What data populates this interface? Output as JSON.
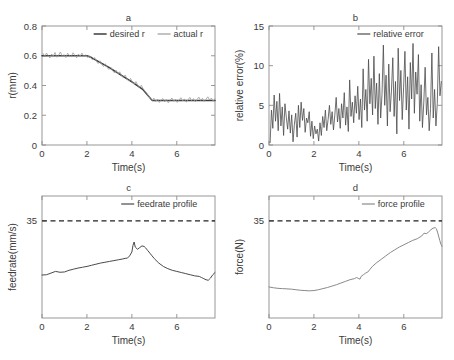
{
  "figure": {
    "type": "multi-panel-line-chart",
    "panel_count": 4,
    "background": "#ffffff"
  },
  "colors": {
    "axis": "#8c8c8c",
    "text": "#3a3a3a",
    "desired": "#3c3c3c",
    "actual": "#9a9a9a",
    "relative_error": "#4a4a4a",
    "feedrate": "#4a4a4a",
    "force": "#8a8a8a",
    "limit": "#222222"
  },
  "chart_data": [
    {
      "type": "line",
      "panel": "a",
      "title": "a",
      "xlabel": "Time(s)",
      "ylabel": "r(mm)",
      "xlim": [
        0,
        7.7
      ],
      "ylim": [
        0,
        0.8
      ],
      "xticks": [
        0,
        2,
        4,
        6
      ],
      "yticks": [
        0,
        0.2,
        0.4,
        0.6,
        0.8
      ],
      "yticklabels": [
        "0",
        "0.2",
        "0.4",
        "0.6",
        "0.8"
      ],
      "xticklabels": [
        "0",
        "2",
        "4",
        "6"
      ],
      "grid": false,
      "legend_position": "top-right",
      "series": [
        {
          "name": "desired r",
          "color": "#3c3c3c",
          "width": 1.5,
          "x": [
            0,
            0.5,
            1,
            1.5,
            2,
            2.2,
            2.5,
            3,
            3.5,
            4,
            4.5,
            4.9,
            5.2,
            5.8,
            6.4,
            7,
            7.7
          ],
          "values": [
            0.6,
            0.6,
            0.6,
            0.6,
            0.6,
            0.588,
            0.562,
            0.52,
            0.472,
            0.424,
            0.372,
            0.3,
            0.3,
            0.3,
            0.3,
            0.3,
            0.3
          ]
        },
        {
          "name": "actual r",
          "color": "#9a9a9a",
          "width": 0.8,
          "x": [
            0.05,
            0.12,
            0.2,
            0.28,
            0.35,
            0.43,
            0.5,
            0.58,
            0.66,
            0.74,
            0.82,
            0.9,
            0.98,
            1.06,
            1.14,
            1.22,
            1.3,
            1.38,
            1.46,
            1.54,
            1.62,
            1.7,
            1.78,
            1.86,
            1.94,
            2.02,
            2.1,
            2.18,
            2.26,
            2.34,
            2.42,
            2.5,
            2.58,
            2.66,
            2.74,
            2.82,
            2.9,
            2.98,
            3.06,
            3.14,
            3.22,
            3.3,
            3.38,
            3.46,
            3.54,
            3.62,
            3.7,
            3.78,
            3.86,
            3.94,
            4.02,
            4.1,
            4.18,
            4.26,
            4.34,
            4.42,
            4.5,
            4.58,
            4.66,
            4.74,
            4.82,
            4.9,
            4.98,
            5.06,
            5.14,
            5.22,
            5.3,
            5.38,
            5.46,
            5.54,
            5.62,
            5.7,
            5.78,
            5.86,
            5.94,
            6.02,
            6.1,
            6.18,
            6.26,
            6.34,
            6.42,
            6.5,
            6.58,
            6.66,
            6.74,
            6.82,
            6.9,
            6.98,
            7.06,
            7.14,
            7.22,
            7.3,
            7.38,
            7.46,
            7.54,
            7.62,
            7.7
          ],
          "values": [
            0.615,
            0.595,
            0.618,
            0.6,
            0.585,
            0.612,
            0.598,
            0.622,
            0.59,
            0.605,
            0.625,
            0.596,
            0.608,
            0.588,
            0.617,
            0.601,
            0.592,
            0.62,
            0.603,
            0.586,
            0.612,
            0.598,
            0.618,
            0.594,
            0.607,
            0.589,
            0.601,
            0.583,
            0.572,
            0.588,
            0.564,
            0.548,
            0.566,
            0.542,
            0.528,
            0.546,
            0.522,
            0.508,
            0.524,
            0.5,
            0.486,
            0.502,
            0.478,
            0.492,
            0.468,
            0.452,
            0.47,
            0.446,
            0.43,
            0.448,
            0.424,
            0.41,
            0.426,
            0.402,
            0.388,
            0.402,
            0.378,
            0.362,
            0.348,
            0.33,
            0.312,
            0.298,
            0.315,
            0.292,
            0.308,
            0.286,
            0.302,
            0.312,
            0.29,
            0.306,
            0.284,
            0.3,
            0.316,
            0.294,
            0.308,
            0.286,
            0.302,
            0.318,
            0.296,
            0.31,
            0.288,
            0.304,
            0.32,
            0.298,
            0.312,
            0.29,
            0.306,
            0.322,
            0.3,
            0.314,
            0.292,
            0.308,
            0.324,
            0.302,
            0.316,
            0.294,
            0.31
          ]
        }
      ]
    },
    {
      "type": "line",
      "panel": "b",
      "title": "b",
      "xlabel": "Time(s)",
      "ylabel": "relative error(%)",
      "xlim": [
        0,
        7.7
      ],
      "ylim": [
        0,
        15
      ],
      "xticks": [
        0,
        2,
        4,
        6
      ],
      "yticks": [
        0,
        5,
        10,
        15
      ],
      "yticklabels": [
        "0",
        "5",
        "10",
        "15"
      ],
      "xticklabels": [
        "0",
        "2",
        "4",
        "6"
      ],
      "grid": false,
      "legend_position": "top-right",
      "series": [
        {
          "name": "relative error",
          "color": "#4a4a4a",
          "width": 0.8,
          "x": [
            0.05,
            0.11,
            0.17,
            0.23,
            0.29,
            0.35,
            0.41,
            0.47,
            0.53,
            0.59,
            0.65,
            0.71,
            0.77,
            0.83,
            0.89,
            0.95,
            1.01,
            1.07,
            1.13,
            1.19,
            1.25,
            1.31,
            1.37,
            1.43,
            1.49,
            1.55,
            1.61,
            1.67,
            1.73,
            1.79,
            1.85,
            1.91,
            1.97,
            2.03,
            2.09,
            2.15,
            2.21,
            2.27,
            2.33,
            2.39,
            2.45,
            2.51,
            2.57,
            2.63,
            2.69,
            2.75,
            2.81,
            2.87,
            2.93,
            2.99,
            3.05,
            3.11,
            3.17,
            3.23,
            3.29,
            3.35,
            3.41,
            3.47,
            3.53,
            3.59,
            3.65,
            3.71,
            3.77,
            3.83,
            3.89,
            3.95,
            4.01,
            4.07,
            4.13,
            4.19,
            4.25,
            4.31,
            4.37,
            4.43,
            4.49,
            4.55,
            4.61,
            4.67,
            4.73,
            4.79,
            4.85,
            4.91,
            4.97,
            5.03,
            5.09,
            5.15,
            5.21,
            5.27,
            5.33,
            5.39,
            5.45,
            5.51,
            5.57,
            5.63,
            5.69,
            5.75,
            5.81,
            5.87,
            5.93,
            5.99,
            6.05,
            6.11,
            6.17,
            6.23,
            6.29,
            6.35,
            6.41,
            6.47,
            6.53,
            6.59,
            6.65,
            6.71,
            6.77,
            6.83,
            6.89,
            6.95,
            7.01,
            7.07,
            7.13,
            7.19,
            7.25,
            7.31,
            7.37,
            7.43,
            7.49,
            7.55,
            7.61,
            7.67
          ],
          "values": [
            0.3,
            4.4,
            2.1,
            6.3,
            3.0,
            5.5,
            1.8,
            6.5,
            2.4,
            4.8,
            1.2,
            5.2,
            3.5,
            2.0,
            4.3,
            1.5,
            3.8,
            0.4,
            2.6,
            4.0,
            1.0,
            5.0,
            2.2,
            5.4,
            3.1,
            4.6,
            1.6,
            3.4,
            2.8,
            4.2,
            1.1,
            3.0,
            0.8,
            2.4,
            1.4,
            2.0,
            0.5,
            2.8,
            1.2,
            3.6,
            2.2,
            4.4,
            1.8,
            3.2,
            5.0,
            2.6,
            4.2,
            1.9,
            3.8,
            6.0,
            2.9,
            4.6,
            2.1,
            5.2,
            3.4,
            6.6,
            2.5,
            4.8,
            1.7,
            8.2,
            3.6,
            5.4,
            2.8,
            6.2,
            4.0,
            7.4,
            3.2,
            5.8,
            2.2,
            9.6,
            4.4,
            7.0,
            3.0,
            10.8,
            5.2,
            8.4,
            3.8,
            11.2,
            4.6,
            7.8,
            2.6,
            9.0,
            3.4,
            6.4,
            12.6,
            5.0,
            8.8,
            2.4,
            10.2,
            4.2,
            6.8,
            11.0,
            3.6,
            8.0,
            1.4,
            12.2,
            5.6,
            9.4,
            3.2,
            7.2,
            11.8,
            4.4,
            8.6,
            2.0,
            10.4,
            5.8,
            12.8,
            4.0,
            9.2,
            6.4,
            11.4,
            3.0,
            7.6,
            2.2,
            5.4,
            9.8,
            3.8,
            6.0,
            1.8,
            4.6,
            11.6,
            3.4,
            7.0,
            2.4,
            5.2,
            12.4,
            6.2,
            8.0
          ]
        }
      ]
    },
    {
      "type": "line",
      "panel": "c",
      "title": "c",
      "xlabel": "Time(s)",
      "ylabel": "feedrate(mm/s)",
      "xlim": [
        0,
        7.7
      ],
      "ylim": [
        0,
        44
      ],
      "xticks": [
        0,
        2,
        4,
        6
      ],
      "yticks": [
        35
      ],
      "yticklabels": [
        "35"
      ],
      "xticklabels": [
        "0",
        "2",
        "4",
        "6"
      ],
      "grid": false,
      "legend_position": "top-right",
      "limit_line": {
        "value": 35,
        "style": "dashed",
        "color": "#222222"
      },
      "series": [
        {
          "name": "feedrate profile",
          "color": "#4a4a4a",
          "width": 1.0,
          "x": [
            0,
            0.2,
            0.4,
            0.6,
            0.8,
            1.0,
            1.2,
            1.4,
            1.6,
            1.8,
            2.0,
            2.2,
            2.4,
            2.6,
            2.8,
            3.0,
            3.2,
            3.4,
            3.6,
            3.7,
            3.8,
            3.9,
            4.0,
            4.05,
            4.1,
            4.15,
            4.25,
            4.35,
            4.45,
            4.55,
            4.6,
            4.7,
            4.8,
            4.9,
            5.0,
            5.2,
            5.4,
            5.6,
            5.8,
            6.0,
            6.2,
            6.4,
            6.6,
            6.8,
            7.0,
            7.1,
            7.2,
            7.3,
            7.4,
            7.5,
            7.6,
            7.7
          ],
          "values": [
            15.5,
            15.6,
            16.2,
            16.8,
            16.5,
            16.6,
            17.2,
            17.6,
            18.0,
            18.3,
            18.6,
            19.0,
            19.4,
            19.8,
            20.1,
            20.4,
            20.7,
            21.0,
            21.3,
            21.5,
            21.6,
            22.4,
            23.8,
            26.2,
            27.4,
            25.6,
            24.8,
            25.4,
            26.0,
            25.8,
            25.4,
            24.4,
            23.4,
            22.4,
            21.4,
            19.8,
            18.6,
            17.8,
            17.2,
            16.8,
            16.4,
            16.0,
            15.6,
            15.2,
            15.0,
            14.6,
            14.2,
            13.8,
            13.6,
            14.4,
            15.6,
            16.4
          ]
        }
      ]
    },
    {
      "type": "line",
      "panel": "d",
      "title": "d",
      "xlabel": "Time(s)",
      "ylabel": "force(N)",
      "xlim": [
        0,
        7.7
      ],
      "ylim": [
        0,
        44
      ],
      "xticks": [
        0,
        2,
        4,
        6
      ],
      "yticks": [
        35
      ],
      "yticklabels": [
        "35"
      ],
      "xticklabels": [
        "0",
        "2",
        "4",
        "6"
      ],
      "grid": false,
      "legend_position": "top-right",
      "limit_line": {
        "value": 35,
        "style": "dashed",
        "color": "#222222"
      },
      "series": [
        {
          "name": "force profile",
          "color": "#8a8a8a",
          "width": 1.0,
          "x": [
            0,
            0.2,
            0.4,
            0.6,
            0.8,
            1.0,
            1.2,
            1.4,
            1.6,
            1.8,
            2.0,
            2.2,
            2.4,
            2.6,
            2.8,
            3.0,
            3.2,
            3.4,
            3.6,
            3.8,
            3.9,
            4.0,
            4.05,
            4.1,
            4.2,
            4.3,
            4.4,
            4.5,
            4.6,
            4.8,
            5.0,
            5.2,
            5.4,
            5.6,
            5.8,
            6.0,
            6.2,
            6.4,
            6.6,
            6.8,
            6.9,
            7.0,
            7.1,
            7.2,
            7.3,
            7.4,
            7.45,
            7.5,
            7.6,
            7.65,
            7.7
          ],
          "values": [
            11.2,
            10.9,
            10.7,
            10.6,
            10.5,
            10.4,
            10.2,
            10.0,
            9.9,
            9.8,
            9.9,
            10.2,
            10.6,
            11.0,
            11.5,
            12.0,
            12.6,
            13.2,
            13.8,
            14.2,
            14.6,
            14.2,
            14.0,
            15.0,
            15.6,
            16.2,
            16.6,
            17.6,
            18.6,
            20.0,
            21.2,
            22.4,
            23.6,
            24.6,
            25.6,
            26.4,
            27.2,
            28.0,
            28.6,
            29.6,
            30.6,
            30.4,
            31.0,
            31.8,
            32.4,
            32.6,
            32.2,
            31.0,
            28.0,
            26.6,
            25.8
          ]
        }
      ]
    }
  ]
}
